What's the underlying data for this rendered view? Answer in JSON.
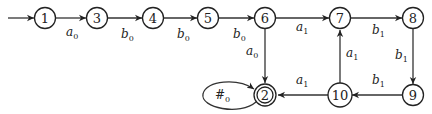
{
  "diagram": {
    "type": "finite-automaton",
    "initial_state": "1",
    "accepting_states": [
      "2"
    ],
    "nodes": [
      {
        "id": "1",
        "label": "1",
        "x": 45,
        "y": 18
      },
      {
        "id": "3",
        "label": "3",
        "x": 97,
        "y": 18
      },
      {
        "id": "4",
        "label": "4",
        "x": 153,
        "y": 18
      },
      {
        "id": "5",
        "label": "5",
        "x": 208,
        "y": 18
      },
      {
        "id": "6",
        "label": "6",
        "x": 265,
        "y": 18
      },
      {
        "id": "7",
        "label": "7",
        "x": 340,
        "y": 18
      },
      {
        "id": "8",
        "label": "8",
        "x": 413,
        "y": 18
      },
      {
        "id": "2",
        "label": "2",
        "x": 265,
        "y": 95,
        "accepting": true
      },
      {
        "id": "10",
        "label": "10",
        "x": 340,
        "y": 95
      },
      {
        "id": "9",
        "label": "9",
        "x": 413,
        "y": 95
      }
    ],
    "edges": [
      {
        "from": "1",
        "to": "3",
        "sym": "a",
        "sub": "0"
      },
      {
        "from": "3",
        "to": "4",
        "sym": "b",
        "sub": "0"
      },
      {
        "from": "4",
        "to": "5",
        "sym": "b",
        "sub": "0"
      },
      {
        "from": "5",
        "to": "6",
        "sym": "b",
        "sub": "0"
      },
      {
        "from": "6",
        "to": "7",
        "sym": "a",
        "sub": "1"
      },
      {
        "from": "7",
        "to": "8",
        "sym": "b",
        "sub": "1"
      },
      {
        "from": "6",
        "to": "2",
        "sym": "a",
        "sub": "0"
      },
      {
        "from": "8",
        "to": "9",
        "sym": "b",
        "sub": "1"
      },
      {
        "from": "9",
        "to": "10",
        "sym": "b",
        "sub": "1"
      },
      {
        "from": "10",
        "to": "7",
        "sym": "a",
        "sub": "1"
      },
      {
        "from": "10",
        "to": "2",
        "sym": "a",
        "sub": "1"
      },
      {
        "from": "2",
        "to": "2",
        "sym": "#",
        "sub": "0",
        "self_loop": true
      }
    ]
  },
  "labels": {
    "n1": "1",
    "n3": "3",
    "n4": "4",
    "n5": "5",
    "n6": "6",
    "n7": "7",
    "n8": "8",
    "n2": "2",
    "n10": "10",
    "n9": "9",
    "e13_sym": "a",
    "e13_sub": "0",
    "e34_sym": "b",
    "e34_sub": "0",
    "e45_sym": "b",
    "e45_sub": "0",
    "e56_sym": "b",
    "e56_sub": "0",
    "e67_sym": "a",
    "e67_sub": "1",
    "e78_sym": "b",
    "e78_sub": "1",
    "e62_sym": "a",
    "e62_sub": "0",
    "e89_sym": "b",
    "e89_sub": "1",
    "e910_sym": "b",
    "e910_sub": "1",
    "e107_sym": "a",
    "e107_sub": "1",
    "e102_sym": "a",
    "e102_sub": "1",
    "e22_sym": "#",
    "e22_sub": "0"
  }
}
